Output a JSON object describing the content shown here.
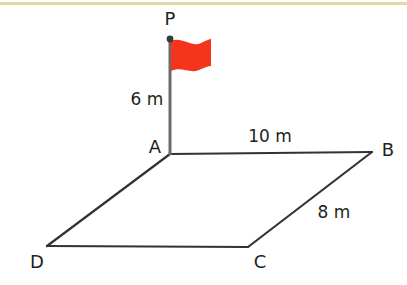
{
  "figure": {
    "background_color": "#ffffff",
    "top_rule_color": "#e8d5a8",
    "line_color": "#333333",
    "pole_color": "#6b6b6b",
    "flag_color": "#f4341b",
    "point_marker_color": "#3a3a3a",
    "vertices": [
      {
        "id": "P",
        "label": "P",
        "x": 170,
        "y": 39
      },
      {
        "id": "A",
        "label": "A",
        "x": 170,
        "y": 154
      },
      {
        "id": "B",
        "label": "B",
        "x": 372,
        "y": 152
      },
      {
        "id": "C",
        "label": "C",
        "x": 248,
        "y": 247
      },
      {
        "id": "D",
        "label": "D",
        "x": 47,
        "y": 246
      }
    ],
    "edges": [
      {
        "id": "PA",
        "label": "6 m",
        "from": "P",
        "to": "A"
      },
      {
        "id": "AB",
        "label": "10 m",
        "from": "A",
        "to": "B"
      },
      {
        "id": "BC",
        "label": "8 m",
        "from": "B",
        "to": "C"
      },
      {
        "id": "CD",
        "label": "",
        "from": "C",
        "to": "D"
      },
      {
        "id": "DA",
        "label": "",
        "from": "D",
        "to": "A"
      }
    ],
    "labels": {
      "point_p": "P",
      "point_a": "A",
      "point_b": "B",
      "point_c": "C",
      "point_d": "D",
      "height_pa": "6 m",
      "length_ab": "10 m",
      "length_bc": "8 m"
    }
  }
}
